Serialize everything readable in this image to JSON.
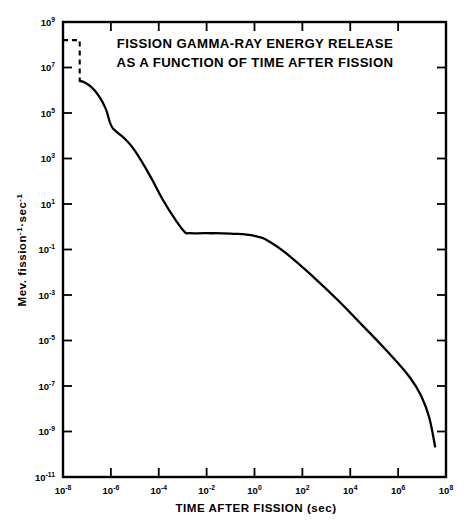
{
  "chart_data": {
    "type": "line",
    "title": "FISSION GAMMA-RAY ENERGY RELEASE AS A FUNCTION OF TIME AFTER FISSION",
    "title_line1": "FISSION GAMMA-RAY ENERGY RELEASE",
    "title_line2": "AS A FUNCTION OF TIME AFTER FISSION",
    "xlabel": "TIME AFTER FISSION (sec)",
    "ylabel": "Mev. fission⁻¹·sec⁻¹",
    "ylabel_parts": {
      "base1": "Mev. fission",
      "sup1": "-1",
      "mid": "·sec",
      "sup2": "-1"
    },
    "xscale": "log",
    "yscale": "log",
    "xlim": [
      1e-08,
      100000000.0
    ],
    "ylim": [
      1e-11,
      1000000000.0
    ],
    "grid": false,
    "legend": null,
    "x_tick_labels": [
      "10-8",
      "10-6",
      "10-4",
      "10-2",
      "100",
      "102",
      "104",
      "106",
      "108"
    ],
    "x_tick_mantissa": "10",
    "x_tick_exponents": [
      "-8",
      "-6",
      "-4",
      "-2",
      "0",
      "2",
      "4",
      "6",
      "8"
    ],
    "x_tick_values": [
      1e-08,
      1e-06,
      0.0001,
      0.01,
      1,
      100,
      10000,
      1000000,
      100000000
    ],
    "y_tick_exponents": [
      "9",
      "7",
      "5",
      "3",
      "1",
      "-1",
      "-3",
      "-5",
      "-7",
      "-9",
      "-11"
    ],
    "y_tick_values": [
      1000000000.0,
      10000000.0,
      100000.0,
      1000.0,
      10.0,
      0.1,
      0.001,
      1e-05,
      1e-07,
      1e-09,
      1e-11
    ],
    "series": [
      {
        "name": "prompt-plus-delayed-gamma-emission",
        "style": "solid",
        "points": [
          {
            "x": 5e-08,
            "y": 2600000.0
          },
          {
            "x": 8e-08,
            "y": 2200000.0
          },
          {
            "x": 1.5e-07,
            "y": 1400000.0
          },
          {
            "x": 3e-07,
            "y": 600000.0
          },
          {
            "x": 6e-07,
            "y": 160000.0
          },
          {
            "x": 1e-06,
            "y": 30000.0
          },
          {
            "x": 1.6e-06,
            "y": 16000.0
          },
          {
            "x": 4e-06,
            "y": 7000.0
          },
          {
            "x": 1e-05,
            "y": 2200.0
          },
          {
            "x": 4e-05,
            "y": 200.0
          },
          {
            "x": 0.00015,
            "y": 15.0
          },
          {
            "x": 0.0005,
            "y": 2.0
          },
          {
            "x": 0.0012,
            "y": 0.6
          },
          {
            "x": 0.002,
            "y": 0.52
          },
          {
            "x": 0.01,
            "y": 0.52
          },
          {
            "x": 0.1,
            "y": 0.5
          },
          {
            "x": 1.0,
            "y": 0.4
          },
          {
            "x": 5.0,
            "y": 0.2
          },
          {
            "x": 30.0,
            "y": 0.05
          },
          {
            "x": 300.0,
            "y": 0.006
          },
          {
            "x": 3000.0,
            "y": 0.0006
          },
          {
            "x": 30000.0,
            "y": 5e-05
          },
          {
            "x": 300000.0,
            "y": 4e-06
          },
          {
            "x": 3000000.0,
            "y": 2.5e-07
          },
          {
            "x": 10000000.0,
            "y": 3e-08
          },
          {
            "x": 20000000.0,
            "y": 4e-09
          },
          {
            "x": 35000000.0,
            "y": 2.2e-10
          }
        ]
      },
      {
        "name": "prompt-fission-gamma-burst",
        "style": "dashed",
        "points": [
          {
            "x": 1e-08,
            "y": 160000000.0
          },
          {
            "x": 5e-08,
            "y": 160000000.0
          },
          {
            "x": 5e-08,
            "y": 2600000.0
          }
        ]
      }
    ],
    "annotations": [
      {
        "text": "FISSION GAMMA-RAY ENERGY RELEASE",
        "role": "title-line-1"
      },
      {
        "text": "AS A FUNCTION OF TIME AFTER FISSION",
        "role": "title-line-2"
      }
    ],
    "colors": {
      "curve": "#000000",
      "axis": "#000000",
      "background": "#ffffff"
    }
  }
}
